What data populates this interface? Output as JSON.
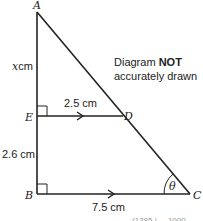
{
  "diagram": {
    "type": "geometry-triangle",
    "points": {
      "A": {
        "label": "A",
        "x": 37,
        "y": 12
      },
      "B": {
        "label": "B",
        "x": 37,
        "y": 194
      },
      "C": {
        "label": "C",
        "x": 190,
        "y": 194
      },
      "D": {
        "label": "D",
        "x": 123,
        "y": 116
      },
      "E": {
        "label": "E",
        "x": 37,
        "y": 116
      }
    },
    "measurements": {
      "AE": "x cm",
      "AE_var": "x",
      "AE_unit": "cm",
      "ED": "2.5 cm",
      "EB": "2.6 cm",
      "BC": "7.5 cm"
    },
    "angle_label": "θ",
    "note_line1": "Diagram",
    "note_bold": "NOT",
    "note_line2": "accurately drawn",
    "footer": "(1385 | ... 1000"
  }
}
